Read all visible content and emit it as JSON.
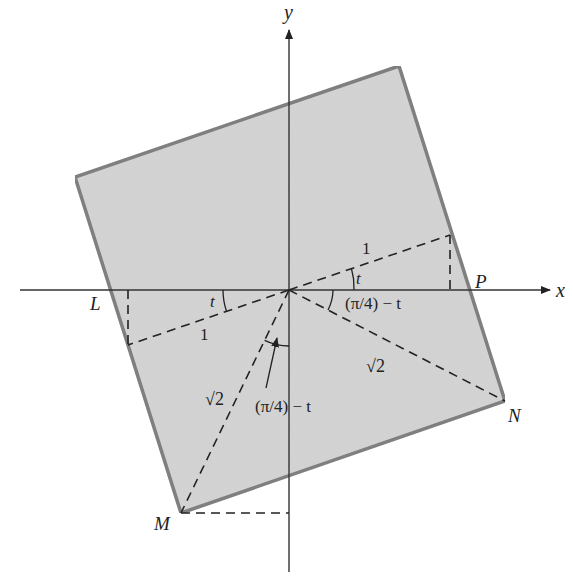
{
  "figure": {
    "type": "geometry-diagram",
    "colors": {
      "square_fill": "#d4d4d4",
      "square_stroke": "#7a7a7a",
      "axis": "#333333",
      "dashed": "#222222",
      "text": "#222222"
    },
    "axes": {
      "x_label": "x",
      "y_label": "y"
    },
    "points": {
      "origin": {
        "x": 289,
        "y": 290
      },
      "square_top_left": {
        "x": 75,
        "y": 177
      },
      "square_top_right": {
        "x": 399,
        "y": 66
      },
      "N": {
        "x": 505,
        "y": 401
      },
      "M": {
        "x": 181,
        "y": 513
      },
      "upper_unit_end": {
        "x": 450,
        "y": 235
      },
      "lower_unit_end": {
        "x": 128,
        "y": 345
      }
    },
    "labels": {
      "L": "L",
      "P": "P",
      "M": "M",
      "N": "N",
      "one_upper": "1",
      "one_lower": "1",
      "t_upper": "t",
      "t_lower": "t",
      "sqrt2_right": "√2",
      "sqrt2_left": "√2",
      "angle_right": "(π/4) − t",
      "angle_lower": "(π/4) − t"
    }
  }
}
